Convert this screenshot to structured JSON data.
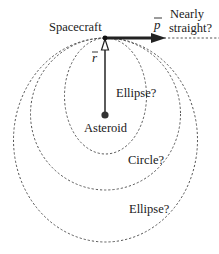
{
  "labels": {
    "spacecraft": "Spacecraft",
    "momentum": "p",
    "position": "r",
    "nearly": "Nearly",
    "straight": "straight?",
    "asteroid": "Asteroid",
    "ellipse_inner": "Ellipse?",
    "circle": "Circle?",
    "ellipse_outer": "Ellipse?"
  },
  "colors": {
    "stroke": "#1a1a1a",
    "dashed": "#555555"
  }
}
